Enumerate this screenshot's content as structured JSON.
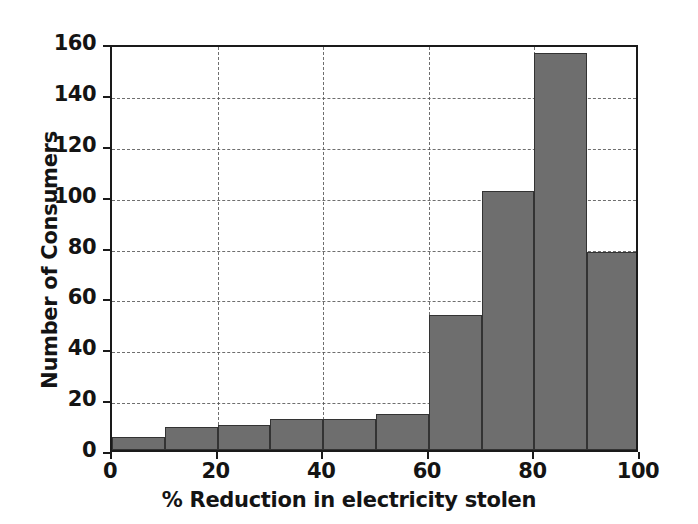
{
  "chart_data": {
    "type": "bar",
    "title": "",
    "xlabel": "% Reduction in electricity stolen",
    "ylabel": "Number of Consumers",
    "categories": [
      "0-10",
      "10-20",
      "20-30",
      "30-40",
      "40-50",
      "50-60",
      "60-70",
      "70-80",
      "80-90",
      "90-100"
    ],
    "bin_edges": [
      0,
      10,
      20,
      30,
      40,
      50,
      60,
      70,
      80,
      90,
      100
    ],
    "values": [
      5,
      9,
      10,
      12,
      12,
      14,
      53,
      102,
      156,
      78
    ],
    "xlim": [
      0,
      100
    ],
    "ylim": [
      0,
      160
    ],
    "xticks": [
      "0",
      "20",
      "40",
      "60",
      "80",
      "100"
    ],
    "xtick_values": [
      0,
      20,
      40,
      60,
      80,
      100
    ],
    "yticks": [
      "0",
      "20",
      "40",
      "60",
      "80",
      "100",
      "120",
      "140",
      "160"
    ],
    "ytick_values": [
      0,
      20,
      40,
      60,
      80,
      100,
      120,
      140,
      160
    ],
    "grid": true,
    "grid_style": "dashed",
    "legend": null,
    "bar_color": "#6e6e6e",
    "bar_edge_color": "#333333",
    "axis_color": "#1a1a1a",
    "background_color": "#ffffff"
  }
}
